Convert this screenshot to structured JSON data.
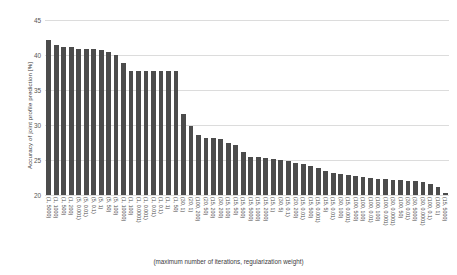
{
  "chart_data": {
    "type": "bar",
    "title": "",
    "xlabel": "(maximum number of iterations, regularization weight)",
    "ylabel": "Accuracy of joint profile prediction [%]",
    "ylim": [
      20,
      45
    ],
    "yticks": [
      20,
      25,
      30,
      35,
      40,
      45
    ],
    "grid": true,
    "legend": "none",
    "bar_color": "#4c4c4c",
    "categories": [
      "(1, 5000)",
      "(1, 1000)",
      "(1, 500)",
      "(1, 200)",
      "(5, 0.001)",
      "(5, 0.01)",
      "(5, 0.1)",
      "(5, 1)",
      "(5, 50)",
      "(5, 100)",
      "(1, 10000)",
      "(1, 100)",
      "(1, 0.0001)",
      "(1, 0.001)",
      "(1, 0.01)",
      "(1, 0.1)",
      "(1, 1)",
      "(1, 50)",
      "(30, 1)",
      "(20, 1)",
      "(100, 200)",
      "(20, 50)",
      "(15, 200)",
      "(30, 200)",
      "(15, 100)",
      "(15, 50)",
      "(15, 500)",
      "(15, 5000)",
      "(15, 1000)",
      "(15, 2000)",
      "(15, 1)",
      "(30, 5)",
      "(15, 0.1)",
      "(20, 200)",
      "(15, 0.01)",
      "(15, 500)",
      "(15, 0.001)",
      "(15, 5)",
      "(15, 0.01)",
      "(30, 100)",
      "(15, 0.001)",
      "(100, 500)",
      "(100, 100)",
      "(100, 0.01)",
      "(100, 100)",
      "(100, 0.001)",
      "(30, 0.0001)",
      "(100, 50)",
      "(30, 0.01)",
      "(30, 5000)",
      "(30, 0.0001)",
      "(100, 0.1)",
      "(100, 1)",
      "(15, 5000)"
    ],
    "values": [
      42.1,
      41.4,
      41.2,
      41.1,
      40.8,
      40.9,
      40.8,
      40.7,
      40.5,
      40.0,
      38.9,
      37.7,
      37.7,
      37.7,
      37.7,
      37.7,
      37.7,
      37.7,
      31.6,
      29.8,
      28.6,
      28.2,
      28.1,
      28.0,
      27.4,
      27.1,
      26.1,
      25.5,
      25.4,
      25.3,
      25.2,
      25.0,
      24.8,
      24.6,
      24.4,
      24.2,
      23.8,
      23.4,
      23.2,
      23.0,
      22.9,
      22.7,
      22.6,
      22.4,
      22.3,
      22.3,
      22.2,
      22.1,
      22.0,
      22.0,
      21.8,
      21.6,
      21.2,
      20.3
    ]
  }
}
